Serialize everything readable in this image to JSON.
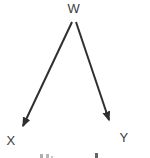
{
  "diagram": {
    "type": "directed-graph",
    "nodes": [
      {
        "id": "W",
        "label": "W",
        "position": "top-center",
        "role": "common-cause"
      },
      {
        "id": "X",
        "label": "X",
        "position": "bottom-left"
      },
      {
        "id": "Y",
        "label": "Y",
        "position": "bottom-right"
      }
    ],
    "edges": [
      {
        "from": "W",
        "to": "X",
        "style": "solid-arrow"
      },
      {
        "from": "W",
        "to": "Y",
        "style": "solid-arrow"
      }
    ],
    "colors": {
      "ink": "#3c3c3c",
      "arrow": "#2f2f2f",
      "background": "#ffffff"
    },
    "clipped_caption": ""
  }
}
